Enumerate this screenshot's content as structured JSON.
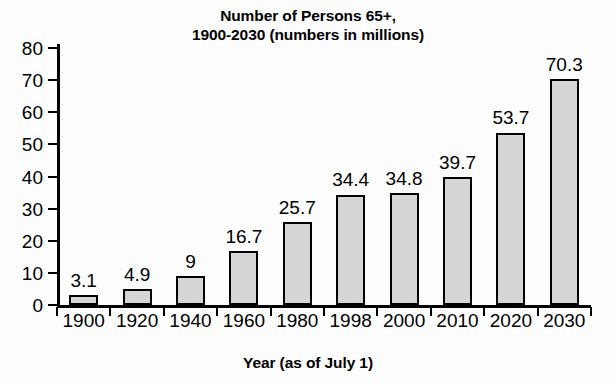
{
  "chart_data": {
    "type": "bar",
    "title": "Number of Persons 65+,\n1900-2030 (numbers in millions)",
    "title_lines": [
      "Number of Persons 65+,",
      "1900-2030 (numbers in millions)"
    ],
    "xlabel": "Year (as of July 1)",
    "ylabel": "",
    "ylim": [
      0,
      80
    ],
    "ytick_step": 10,
    "ytick_labels": [
      "0",
      "10",
      "20",
      "30",
      "40",
      "50",
      "60",
      "70",
      "80"
    ],
    "grid": false,
    "legend": null,
    "categories": [
      "1900",
      "1920",
      "1940",
      "1960",
      "1980",
      "1998",
      "2000",
      "2010",
      "2020",
      "2030"
    ],
    "values": [
      3.1,
      4.9,
      9,
      16.7,
      25.7,
      34.4,
      34.8,
      39.7,
      53.7,
      70.3
    ],
    "value_labels": [
      "3.1",
      "4.9",
      "9",
      "16.7",
      "25.7",
      "34.4",
      "34.8",
      "39.7",
      "53.7",
      "70.3"
    ],
    "bar_color": "#d6d6d6",
    "bar_edge_color": "#000000",
    "background_color": "#fdfdfd"
  }
}
